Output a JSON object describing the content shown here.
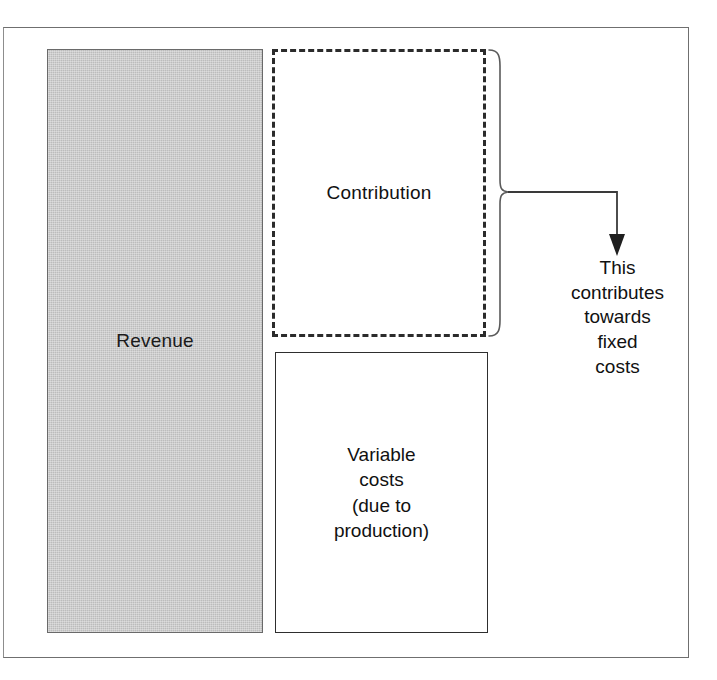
{
  "figure": {
    "type": "block-diagram",
    "background_color": "#ffffff",
    "frame_border_color": "#6f6f6f"
  },
  "blocks": {
    "revenue": {
      "label": "Revenue",
      "fill_color": "#bcbcbc",
      "border_color": "#6a6a6a",
      "border_style": "solid"
    },
    "contribution": {
      "label": "Contribution",
      "fill_color": "#ffffff",
      "border_color": "#2b2b2b",
      "border_style": "dashed"
    },
    "variable_costs": {
      "label_lines": [
        "Variable",
        "costs",
        "(due to",
        "production)"
      ],
      "fill_color": "#ffffff",
      "border_color": "#2e2e2e",
      "border_style": "solid"
    }
  },
  "annotation": {
    "lines": [
      "This",
      "contributes",
      "towards",
      "fixed",
      "costs"
    ],
    "brace_name": "right-curly-brace",
    "arrow_name": "down-arrow",
    "stroke_color": "#3a3a3a"
  },
  "margin_text": {
    "lines": [
      "f",
      "",
      ""
    ]
  }
}
